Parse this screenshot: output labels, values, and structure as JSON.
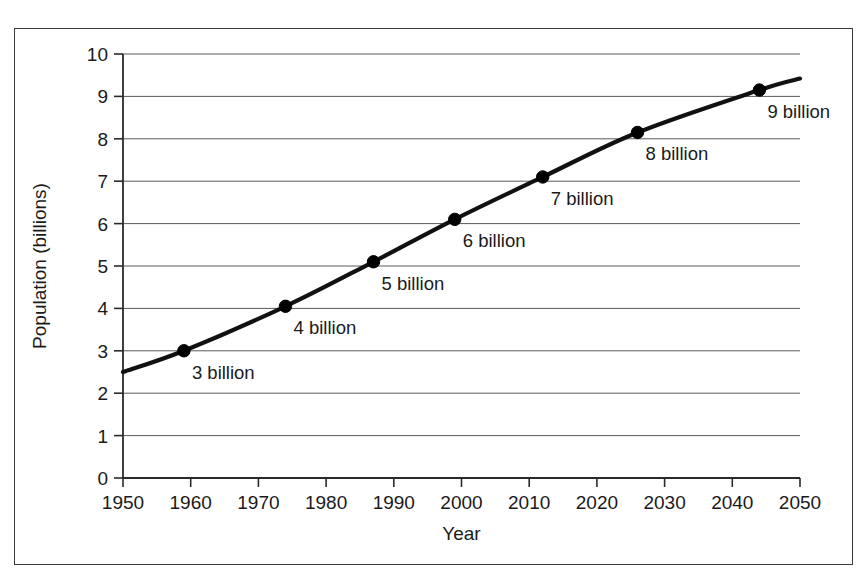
{
  "chart_data": {
    "type": "line",
    "title": "",
    "xlabel": "Year",
    "ylabel": "Population (billions)",
    "xlim": [
      1950,
      2050
    ],
    "ylim": [
      0,
      10
    ],
    "xticks": [
      "1950",
      "1960",
      "1970",
      "1980",
      "1990",
      "2000",
      "2010",
      "2020",
      "2030",
      "2040",
      "2050"
    ],
    "xtick_values": [
      1950,
      1960,
      1970,
      1980,
      1990,
      2000,
      2010,
      2020,
      2030,
      2040,
      2050
    ],
    "yticks": [
      "0",
      "1",
      "2",
      "3",
      "4",
      "5",
      "6",
      "7",
      "8",
      "9",
      "10"
    ],
    "ytick_values": [
      0,
      1,
      2,
      3,
      4,
      5,
      6,
      7,
      8,
      9,
      10
    ],
    "grid": "horizontal",
    "legend": "none",
    "line_color": "#111111",
    "marker_color": "#000000",
    "series": [
      {
        "name": "World population",
        "x": [
          1950,
          1959,
          1974,
          1987,
          1999,
          2012,
          2026,
          2044,
          2050
        ],
        "y": [
          2.5,
          3.0,
          4.05,
          5.1,
          6.1,
          7.1,
          8.15,
          9.15,
          9.42
        ]
      }
    ],
    "points": [
      {
        "label": "3 billion",
        "x": 1959,
        "y": 3.0
      },
      {
        "label": "4 billion",
        "x": 1974,
        "y": 4.05
      },
      {
        "label": "5 billion",
        "x": 1987,
        "y": 5.1
      },
      {
        "label": "6 billion",
        "x": 1999,
        "y": 6.1
      },
      {
        "label": "7 billion",
        "x": 2012,
        "y": 7.1
      },
      {
        "label": "8 billion",
        "x": 2026,
        "y": 8.15
      },
      {
        "label": "9 billion",
        "x": 2044,
        "y": 9.15
      }
    ],
    "annotations": [
      {
        "text": "3 billion",
        "anchor_x": 1959,
        "anchor_y": 3.0,
        "dx": 8,
        "dy": 28
      },
      {
        "text": "4 billion",
        "anchor_x": 1974,
        "anchor_y": 4.05,
        "dx": 8,
        "dy": 28
      },
      {
        "text": "5 billion",
        "anchor_x": 1987,
        "anchor_y": 5.1,
        "dx": 8,
        "dy": 28
      },
      {
        "text": "6 billion",
        "anchor_x": 1999,
        "anchor_y": 6.1,
        "dx": 8,
        "dy": 28
      },
      {
        "text": "7 billion",
        "anchor_x": 2012,
        "anchor_y": 7.1,
        "dx": 8,
        "dy": 28
      },
      {
        "text": "8 billion",
        "anchor_x": 2026,
        "anchor_y": 8.15,
        "dx": 8,
        "dy": 28
      },
      {
        "text": "9 billion",
        "anchor_x": 2044,
        "anchor_y": 9.15,
        "dx": 8,
        "dy": 28
      }
    ]
  }
}
